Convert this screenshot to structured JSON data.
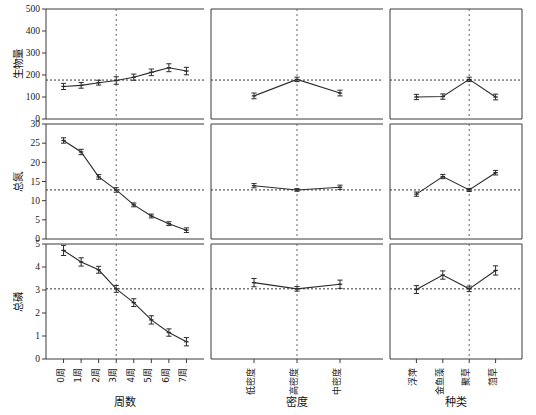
{
  "figure": {
    "type": "multi-panel-line-chart",
    "rows": 3,
    "cols": 3,
    "background": "#ffffff",
    "line_color": "#2b2b2b",
    "ref_line_color": "#333333"
  },
  "rows_meta": [
    {
      "ylabel": "生物量",
      "ymin": 0,
      "ymax": 500,
      "ticks": [
        0,
        100,
        200,
        300,
        400,
        500
      ],
      "ref": 177
    },
    {
      "ylabel": "总氮",
      "ymin": 0,
      "ymax": 30,
      "ticks": [
        0,
        5,
        10,
        15,
        20,
        25,
        30
      ],
      "ref": 12.8
    },
    {
      "ylabel": "总磷",
      "ymin": 0,
      "ymax": 5,
      "ticks": [
        0,
        1,
        2,
        3,
        4,
        5
      ],
      "ref": 3.05
    }
  ],
  "cols_meta": [
    {
      "xtitle": "周数",
      "categories": [
        "0周",
        "1周",
        "2周",
        "3周",
        "4周",
        "5周",
        "6周",
        "7周"
      ],
      "vline_index": 3
    },
    {
      "xtitle": "密度",
      "categories": [
        "低密度",
        "高密度",
        "中密度"
      ],
      "vline_index": 1
    },
    {
      "xtitle": "种类",
      "categories": [
        "浮萍",
        "金鱼藻",
        "聚草",
        "菹草"
      ],
      "vline_index": 2
    }
  ],
  "chart_data": [
    {
      "type": "line",
      "panel": "r1c1",
      "title": "",
      "ylabel": "生物量",
      "xlabel": "周数",
      "categories": [
        "0周",
        "1周",
        "2周",
        "3周",
        "4周",
        "5周",
        "6周",
        "7周"
      ],
      "values": [
        148,
        153,
        165,
        175,
        190,
        212,
        233,
        218
      ],
      "errors": [
        14,
        13,
        11,
        17,
        14,
        15,
        18,
        17
      ],
      "ylim": [
        0,
        500
      ],
      "yticks": [
        0,
        100,
        200,
        300,
        400,
        500
      ],
      "reference_line": 177,
      "vertical_line_at": "3周",
      "grid": false,
      "legend": "none"
    },
    {
      "type": "line",
      "panel": "r2c1",
      "ylabel": "总氮",
      "xlabel": "周数",
      "categories": [
        "0周",
        "1周",
        "2周",
        "3周",
        "4周",
        "5周",
        "6周",
        "7周"
      ],
      "values": [
        25.7,
        22.7,
        16.2,
        12.8,
        8.9,
        6.0,
        4.0,
        2.3
      ],
      "errors": [
        0.7,
        0.7,
        0.6,
        0.6,
        0.5,
        0.5,
        0.5,
        0.6
      ],
      "ylim": [
        0,
        30
      ],
      "yticks": [
        0,
        5,
        10,
        15,
        20,
        25,
        30
      ],
      "reference_line": 12.8,
      "vertical_line_at": "3周",
      "grid": false,
      "legend": "none"
    },
    {
      "type": "line",
      "panel": "r3c1",
      "ylabel": "总磷",
      "xlabel": "周数",
      "categories": [
        "0周",
        "1周",
        "2周",
        "3周",
        "4周",
        "5周",
        "6周",
        "7周"
      ],
      "values": [
        4.72,
        4.22,
        3.88,
        3.05,
        2.45,
        1.7,
        1.15,
        0.75
      ],
      "errors": [
        0.22,
        0.18,
        0.15,
        0.15,
        0.17,
        0.18,
        0.16,
        0.18
      ],
      "ylim": [
        0,
        5
      ],
      "yticks": [
        0,
        1,
        2,
        3,
        4,
        5
      ],
      "reference_line": 3.05,
      "vertical_line_at": "3周",
      "grid": false,
      "legend": "none"
    },
    {
      "type": "line",
      "panel": "r1c2",
      "ylabel": "生物量",
      "xlabel": "密度",
      "categories": [
        "低密度",
        "高密度",
        "中密度"
      ],
      "values": [
        105,
        180,
        118
      ],
      "errors": [
        13,
        10,
        13
      ],
      "ylim": [
        0,
        500
      ],
      "reference_line": 177,
      "vertical_line_at": "高密度",
      "grid": false,
      "legend": "none"
    },
    {
      "type": "line",
      "panel": "r2c2",
      "ylabel": "总氮",
      "xlabel": "密度",
      "categories": [
        "低密度",
        "高密度",
        "中密度"
      ],
      "values": [
        13.9,
        12.8,
        13.5
      ],
      "errors": [
        0.55,
        0.35,
        0.55
      ],
      "ylim": [
        0,
        30
      ],
      "reference_line": 12.8,
      "vertical_line_at": "高密度",
      "grid": false,
      "legend": "none"
    },
    {
      "type": "line",
      "panel": "r3c2",
      "ylabel": "总磷",
      "xlabel": "密度",
      "categories": [
        "低密度",
        "高密度",
        "中密度"
      ],
      "values": [
        3.32,
        3.05,
        3.25
      ],
      "errors": [
        0.18,
        0.1,
        0.18
      ],
      "ylim": [
        0,
        5
      ],
      "reference_line": 3.05,
      "vertical_line_at": "高密度",
      "grid": false,
      "legend": "none"
    },
    {
      "type": "line",
      "panel": "r1c3",
      "ylabel": "生物量",
      "xlabel": "种类",
      "categories": [
        "浮萍",
        "金鱼藻",
        "聚草",
        "菹草"
      ],
      "values": [
        100,
        102,
        180,
        100
      ],
      "errors": [
        12,
        12,
        10,
        13
      ],
      "ylim": [
        0,
        500
      ],
      "reference_line": 177,
      "vertical_line_at": "聚草",
      "grid": false,
      "legend": "none"
    },
    {
      "type": "line",
      "panel": "r2c3",
      "ylabel": "总氮",
      "xlabel": "种类",
      "categories": [
        "浮萍",
        "金鱼藻",
        "聚草",
        "菹草"
      ],
      "values": [
        11.7,
        16.3,
        12.8,
        17.3
      ],
      "errors": [
        0.55,
        0.55,
        0.4,
        0.6
      ],
      "ylim": [
        0,
        30
      ],
      "reference_line": 12.8,
      "vertical_line_at": "聚草",
      "grid": false,
      "legend": "none"
    },
    {
      "type": "line",
      "panel": "r3c3",
      "ylabel": "总磷",
      "xlabel": "种类",
      "categories": [
        "浮萍",
        "金鱼藻",
        "聚草",
        "菹草"
      ],
      "values": [
        3.02,
        3.65,
        3.05,
        3.85
      ],
      "errors": [
        0.17,
        0.18,
        0.12,
        0.2
      ],
      "ylim": [
        0,
        5
      ],
      "reference_line": 3.05,
      "vertical_line_at": "聚草",
      "grid": false,
      "legend": "none"
    }
  ]
}
